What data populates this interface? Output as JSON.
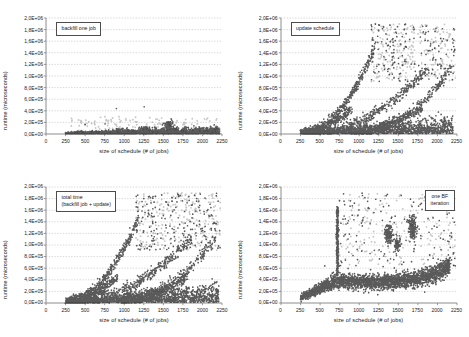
{
  "figure": {
    "title": "",
    "panel_count": 4,
    "background_color": "#ffffff",
    "axis_color": "#808080",
    "grid_color": "#b3b3b3",
    "marker_dark_color": "#1a1a1a",
    "marker_light_color": "#999999"
  },
  "axes_common": {
    "xlabel": "size of schedule (# of jobs)",
    "ylabel": "runtime (microseconds)",
    "xticks": [
      "0",
      "250",
      "500",
      "750",
      "1000",
      "1250",
      "1500",
      "1750",
      "2000",
      "2250"
    ],
    "xtick_values": [
      0,
      250,
      500,
      750,
      1000,
      1250,
      1500,
      1750,
      2000,
      2250
    ],
    "yticks": [
      "0,0E+00",
      "2,0E+05",
      "4,0E+05",
      "6,0E+05",
      "8,0E+05",
      "1,0E+06",
      "1,2E+06",
      "1,4E+06",
      "1,6E+06",
      "1,8E+06",
      "2,0E+06"
    ],
    "ytick_values": [
      0,
      200000,
      400000,
      600000,
      800000,
      1000000,
      1200000,
      1400000,
      1600000,
      1800000,
      2000000
    ],
    "xlim": [
      0,
      2250
    ],
    "ylim": [
      0,
      2000000
    ],
    "grid": "horizontal-dashed"
  },
  "chart_data": [
    {
      "type": "scatter",
      "panel": "top-left",
      "title": "",
      "legend": "backfill one job",
      "legend_position": "upper-left-inside",
      "xlabel": "size of schedule (# of jobs)",
      "ylabel": "runtime (microseconds)",
      "xlim": [
        0,
        2250
      ],
      "ylim": [
        0,
        2000000
      ],
      "xticks": [
        0,
        250,
        500,
        750,
        1000,
        1250,
        1500,
        1750,
        2000,
        2250
      ],
      "yticks": [
        0,
        200000,
        400000,
        600000,
        800000,
        1000000,
        1200000,
        1400000,
        1600000,
        1800000,
        2000000
      ],
      "description": "Dense near-zero band from x=250 to x=2200 with runtime under 1.0E+05; modest bump of points to 2.0E+05 near x=1550-1650; sparse light-grey outliers up to 4.5E+05.",
      "seed": 1017,
      "n_dense": 2400,
      "dense_band": {
        "x_min": 250,
        "x_max": 2220,
        "y_base": 5000,
        "y_spread": 45000
      },
      "bumps": [
        {
          "x_center": 1570,
          "x_width": 70,
          "y_top": 215000,
          "n": 140
        },
        {
          "x_center": 1270,
          "x_width": 80,
          "y_top": 130000,
          "n": 90
        },
        {
          "x_center": 950,
          "x_width": 90,
          "y_top": 95000,
          "n": 70
        }
      ],
      "outliers_light": {
        "n": 150,
        "x_min": 300,
        "x_max": 2200,
        "y_min": 30000,
        "y_max": 300000
      },
      "outliers_extreme": [
        {
          "x": 900,
          "y": 440000
        },
        {
          "x": 1255,
          "y": 470000
        },
        {
          "x": 1600,
          "y": 260000
        },
        {
          "x": 1610,
          "y": 235000
        },
        {
          "x": 500,
          "y": 160000
        },
        {
          "x": 755,
          "y": 175000
        }
      ]
    },
    {
      "type": "scatter",
      "panel": "top-right",
      "title": "",
      "legend": "update schedule",
      "legend_position": "upper-left-inside",
      "xlabel": "size of schedule (# of jobs)",
      "ylabel": "runtime (microseconds)",
      "xlim": [
        0,
        2250
      ],
      "ylim": [
        0,
        2000000
      ],
      "xticks": [
        0,
        250,
        500,
        750,
        1000,
        1250,
        1500,
        1750,
        2000,
        2250
      ],
      "yticks": [
        0,
        200000,
        400000,
        600000,
        800000,
        1000000,
        1200000,
        1400000,
        1600000,
        1800000,
        2000000
      ],
      "description": "Several rising arcs from x=250 upward; a steep branch reaching 1.45E+06 at x=1180; a second branch rising to 1.1E+06 near x=1850; a third branch rising to 1.1E+06 at x=2150; dense low band below 2.0E+05; scattered grey cloud between 1.2E+06 and 1.9E+06 for x>1200.",
      "seed": 2311,
      "n_dense": 1500,
      "dense_band": {
        "x_min": 250,
        "x_max": 2200,
        "y_base": 8000,
        "y_spread": 120000
      },
      "branches": [
        {
          "x0": 260,
          "x1": 1185,
          "y0": 30000,
          "y1": 1450000,
          "power": 2.1,
          "n": 420,
          "jitter_y": 42000,
          "jitter_x": 9
        },
        {
          "x0": 420,
          "x1": 1870,
          "y0": 25000,
          "y1": 1110000,
          "power": 1.9,
          "n": 420,
          "jitter_y": 48000,
          "jitter_x": 11
        },
        {
          "x0": 900,
          "x1": 2165,
          "y0": 30000,
          "y1": 1120000,
          "power": 2.3,
          "n": 330,
          "jitter_y": 45000,
          "jitter_x": 11
        },
        {
          "x0": 300,
          "x1": 900,
          "y0": 20000,
          "y1": 430000,
          "power": 1.7,
          "n": 260,
          "jitter_y": 42000,
          "jitter_x": 9
        },
        {
          "x0": 1000,
          "x1": 1800,
          "y0": 60000,
          "y1": 430000,
          "power": 1.5,
          "n": 220,
          "jitter_y": 40000,
          "jitter_x": 10
        }
      ],
      "cloud_light": {
        "n": 430,
        "x_min": 1150,
        "x_max": 2230,
        "y_min": 900000,
        "y_max": 1900000
      },
      "outliers_extreme": [
        {
          "x": 1245,
          "y": 1790000
        },
        {
          "x": 1490,
          "y": 1850000
        },
        {
          "x": 1550,
          "y": 1680000
        },
        {
          "x": 1645,
          "y": 1630000
        },
        {
          "x": 1820,
          "y": 1760000
        },
        {
          "x": 2060,
          "y": 1600000
        }
      ]
    },
    {
      "type": "scatter",
      "panel": "bottom-left",
      "title": "",
      "legend": "total time\n(backfill job + update)",
      "legend_position": "upper-left-inside",
      "xlabel": "size of schedule (# of jobs)",
      "ylabel": "runtime (microseconds)",
      "xlim": [
        0,
        2250
      ],
      "ylim": [
        0,
        2000000
      ],
      "xticks": [
        0,
        250,
        500,
        750,
        1000,
        1250,
        1500,
        1750,
        2000,
        2250
      ],
      "yticks": [
        0,
        200000,
        400000,
        600000,
        800000,
        1000000,
        1200000,
        1400000,
        1600000,
        1800000,
        2000000
      ],
      "description": "Same shape as update schedule but shifted slightly upward: steep branch to 1.47E+06 at x=1180, secondary branches to 1.1E+06 around x=1850 and x=2150, dense base band below 2.5E+05, grey cloud up to 1.9E+06 for x>1200.",
      "seed": 3779,
      "n_dense": 1600,
      "dense_band": {
        "x_min": 250,
        "x_max": 2210,
        "y_base": 12000,
        "y_spread": 135000
      },
      "branches": [
        {
          "x0": 255,
          "x1": 1180,
          "y0": 40000,
          "y1": 1470000,
          "power": 2.1,
          "n": 440,
          "jitter_y": 44000,
          "jitter_x": 9
        },
        {
          "x0": 420,
          "x1": 1860,
          "y0": 35000,
          "y1": 1130000,
          "power": 1.9,
          "n": 440,
          "jitter_y": 50000,
          "jitter_x": 11
        },
        {
          "x0": 900,
          "x1": 2170,
          "y0": 40000,
          "y1": 1150000,
          "power": 2.3,
          "n": 340,
          "jitter_y": 46000,
          "jitter_x": 11
        },
        {
          "x0": 300,
          "x1": 920,
          "y0": 30000,
          "y1": 450000,
          "power": 1.7,
          "n": 280,
          "jitter_y": 44000,
          "jitter_x": 9
        },
        {
          "x0": 1000,
          "x1": 1810,
          "y0": 70000,
          "y1": 450000,
          "power": 1.5,
          "n": 240,
          "jitter_y": 42000,
          "jitter_x": 10
        }
      ],
      "cloud_light": {
        "n": 440,
        "x_min": 1150,
        "x_max": 2230,
        "y_min": 900000,
        "y_max": 1900000
      },
      "outliers_extreme": [
        {
          "x": 1250,
          "y": 1800000
        },
        {
          "x": 1480,
          "y": 1860000
        },
        {
          "x": 1560,
          "y": 1700000
        },
        {
          "x": 1660,
          "y": 1650000
        },
        {
          "x": 1830,
          "y": 1770000
        },
        {
          "x": 2070,
          "y": 1610000
        }
      ]
    },
    {
      "type": "scatter",
      "panel": "bottom-right",
      "title": "",
      "legend": "one BF\niteration",
      "legend_position": "upper-right-inside",
      "xlabel": "size of schedule (# of jobs)",
      "ylabel": "runtime (microseconds)",
      "xlim": [
        0,
        2250
      ],
      "ylim": [
        0,
        2000000
      ],
      "xticks": [
        0,
        250,
        500,
        750,
        1000,
        1250,
        1500,
        1750,
        2000,
        2250
      ],
      "yticks": [
        0,
        200000,
        400000,
        600000,
        800000,
        1000000,
        1200000,
        1400000,
        1600000,
        1800000,
        2000000
      ],
      "description": "Broad band rising from ~1.0E+05 at x=250 to ~4.0E+05 by x=750 and staying near 3.5E+05-4.5E+05 through x=1800, then rising to ~6.5E+05 by x=2150. A tall narrow spike at x~720 reaching 1.65E+06. Secondary clusters near x=1350-1400 at 1.1E+06-1.3E+06 and x=1650-1700 at 1.2E+06-1.5E+06.",
      "seed": 4663,
      "n_dense": 2600,
      "main_band": [
        {
          "x": 250,
          "y": 95000,
          "spread": 55000
        },
        {
          "x": 400,
          "y": 185000,
          "spread": 70000
        },
        {
          "x": 560,
          "y": 295000,
          "spread": 90000
        },
        {
          "x": 700,
          "y": 375000,
          "spread": 110000
        },
        {
          "x": 900,
          "y": 375000,
          "spread": 110000
        },
        {
          "x": 1100,
          "y": 360000,
          "spread": 110000
        },
        {
          "x": 1350,
          "y": 370000,
          "spread": 115000
        },
        {
          "x": 1600,
          "y": 390000,
          "spread": 120000
        },
        {
          "x": 1800,
          "y": 430000,
          "spread": 130000
        },
        {
          "x": 2000,
          "y": 530000,
          "spread": 130000
        },
        {
          "x": 2160,
          "y": 620000,
          "spread": 120000
        }
      ],
      "spike": {
        "x_center": 722,
        "x_width": 16,
        "y_min": 380000,
        "y_max": 1660000,
        "n": 420
      },
      "clusters": [
        {
          "x_center": 1375,
          "x_width": 45,
          "y_center": 1190000,
          "y_spread": 130000,
          "n": 170
        },
        {
          "x_center": 1680,
          "x_width": 50,
          "y_center": 1300000,
          "y_spread": 180000,
          "n": 180
        },
        {
          "x_center": 1490,
          "x_width": 40,
          "y_center": 1020000,
          "y_spread": 110000,
          "n": 90
        },
        {
          "x_center": 2120,
          "x_width": 40,
          "y_center": 640000,
          "y_spread": 90000,
          "n": 90
        }
      ],
      "cloud_light": {
        "n": 340,
        "x_min": 700,
        "x_max": 2230,
        "y_min": 600000,
        "y_max": 1900000
      },
      "outliers_extreme": [
        {
          "x": 1345,
          "y": 1850000
        },
        {
          "x": 1655,
          "y": 1790000
        },
        {
          "x": 1040,
          "y": 1420000
        },
        {
          "x": 1930,
          "y": 1280000
        },
        {
          "x": 2180,
          "y": 1140000
        },
        {
          "x": 560,
          "y": 640000
        }
      ]
    }
  ]
}
